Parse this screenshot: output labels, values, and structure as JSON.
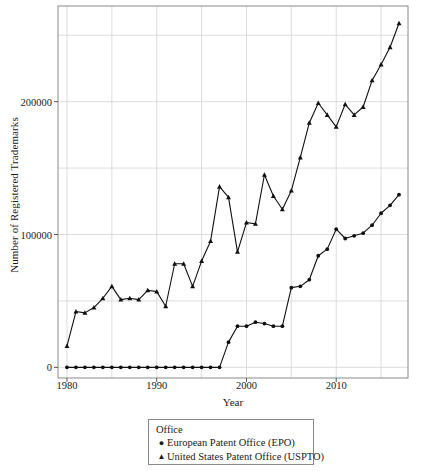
{
  "chart_data": {
    "type": "line",
    "title": "",
    "xlabel": "Year",
    "ylabel": "Number of Registered Trademarks",
    "xlim": [
      1979,
      2018
    ],
    "ylim": [
      -8000,
      272000
    ],
    "xticks": [
      1980,
      1990,
      2000,
      2010
    ],
    "yticks": [
      0,
      100000,
      200000
    ],
    "ytick_labels": [
      "0",
      "100000",
      "200000"
    ],
    "xtick_labels": [
      "1980",
      "1990",
      "2000",
      "2010"
    ],
    "grid": true,
    "grid_minor_y": [
      50000,
      150000,
      250000
    ],
    "grid_minor_x": [
      1985,
      1995,
      2005,
      2015
    ],
    "legend": {
      "title": "Office",
      "position": "below-axes",
      "entries": [
        {
          "label": "European Patent Office (EPO)",
          "marker": "circle"
        },
        {
          "label": "United States Patent Office (USPTO)",
          "marker": "triangle"
        }
      ]
    },
    "x": [
      1980,
      1981,
      1982,
      1983,
      1984,
      1985,
      1986,
      1987,
      1988,
      1989,
      1990,
      1991,
      1992,
      1993,
      1994,
      1995,
      1996,
      1997,
      1998,
      1999,
      2000,
      2001,
      2002,
      2003,
      2004,
      2005,
      2006,
      2007,
      2008,
      2009,
      2010,
      2011,
      2012,
      2013,
      2014,
      2015,
      2016,
      2017
    ],
    "series": [
      {
        "name": "European Patent Office (EPO)",
        "marker": "circle",
        "color": "#101010",
        "values": [
          0,
          0,
          0,
          0,
          0,
          0,
          0,
          0,
          0,
          0,
          0,
          0,
          0,
          0,
          0,
          0,
          0,
          0,
          19000,
          31000,
          31000,
          34000,
          33000,
          31000,
          31000,
          60000,
          61000,
          66000,
          84000,
          89000,
          104000,
          97000,
          99000,
          101000,
          107000,
          116000,
          122000,
          130000
        ]
      },
      {
        "name": "United States Patent Office (USPTO)",
        "marker": "triangle",
        "color": "#101010",
        "values": [
          16000,
          42000,
          41000,
          45000,
          52000,
          61000,
          51000,
          52000,
          51000,
          58000,
          57000,
          46000,
          78000,
          78000,
          61000,
          80000,
          95000,
          136000,
          128000,
          87000,
          109000,
          108000,
          145000,
          129000,
          119000,
          133000,
          158000,
          184000,
          199000,
          190000,
          181000,
          198000,
          190000,
          196000,
          216000,
          228000,
          241000,
          259000
        ]
      }
    ]
  },
  "axes": {
    "ylabel": "Number of Registered Trademarks",
    "xlabel": "Year"
  }
}
